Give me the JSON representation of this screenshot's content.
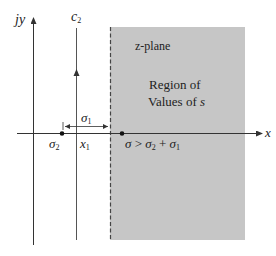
{
  "diagram": {
    "colors": {
      "region_fill": "#c6c6c6",
      "line": "#333333",
      "dashed_boundary": "#444444",
      "background": "#ffffff"
    },
    "axes": {
      "vertical_label_jy": "jy",
      "vertical_label_j": "j",
      "vertical_label_y": "y",
      "horizontal_label": "x"
    },
    "contour": {
      "label_base": "c",
      "label_sub": "2"
    },
    "region": {
      "plane_label": "z-plane",
      "line1": "Region of",
      "line2_prefix": "Values of ",
      "line2_var": "s"
    },
    "markers": {
      "sigma2_base": "σ",
      "sigma2_sub": "2",
      "x1_base": "x",
      "x1_sub": "1",
      "sigma1_base": "σ",
      "sigma1_sub": "1"
    },
    "condition": {
      "lhs": "σ",
      "op": " > ",
      "rhs1_base": "σ",
      "rhs1_sub": "2",
      "plus": " + ",
      "rhs2_base": "σ",
      "rhs2_sub": "1"
    }
  }
}
